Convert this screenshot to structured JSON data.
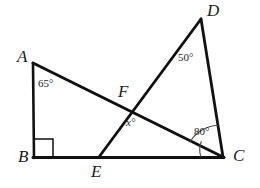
{
  "figure": {
    "kind": "geometry-diagram",
    "stroke_color": "#111111",
    "background_color": "#ffffff",
    "label_color": "#1b1b1b",
    "canvas": {
      "width": 260,
      "height": 188
    },
    "vertices": [
      {
        "id": "A",
        "label": "A",
        "x": 33,
        "y": 63,
        "label_x": 17,
        "label_y": 48
      },
      {
        "id": "B",
        "label": "B",
        "x": 34,
        "y": 158,
        "label_x": 18,
        "label_y": 148
      },
      {
        "id": "C",
        "label": "C",
        "x": 223,
        "y": 158,
        "label_x": 233,
        "label_y": 147
      },
      {
        "id": "D",
        "label": "D",
        "x": 201,
        "y": 19,
        "label_x": 207,
        "label_y": 2
      },
      {
        "id": "E",
        "label": "E",
        "x": 99,
        "y": 157,
        "label_x": 91,
        "label_y": 163
      },
      {
        "id": "F",
        "label": "F",
        "x": 132,
        "y": 109,
        "label_x": 118,
        "label_y": 83
      }
    ],
    "segments": [
      {
        "id": "AB",
        "from": "A",
        "to": "B",
        "width": 2.6
      },
      {
        "id": "BC",
        "from": "B",
        "to": "C",
        "width": 3.0
      },
      {
        "id": "AC",
        "from": "A",
        "to": "C",
        "width": 3.0
      },
      {
        "id": "ED",
        "from": "E",
        "to": "D",
        "width": 2.8
      },
      {
        "id": "DC",
        "from": "D",
        "to": "C",
        "width": 2.8
      }
    ],
    "right_angle_marker": {
      "at": "B",
      "size": 19
    },
    "angle_labels": [
      {
        "id": "angle-a",
        "text": "65°",
        "x": 38,
        "y": 78,
        "variable": false
      },
      {
        "id": "angle-d",
        "text": "50°",
        "x": 178,
        "y": 52,
        "variable": false
      },
      {
        "id": "angle-c",
        "text": "80°",
        "x": 194,
        "y": 126,
        "variable": false
      },
      {
        "id": "angle-f",
        "text": "x°",
        "x": 126,
        "y": 117,
        "variable": true
      }
    ],
    "angle_arcs": [
      {
        "id": "arc-c-outer",
        "at": "C",
        "radius": 33,
        "note": "arc from AC ray to DC ray"
      },
      {
        "id": "arc-c-inner",
        "at": "C",
        "radius": 22,
        "note": "arc from BC ray to AC ray"
      }
    ]
  }
}
